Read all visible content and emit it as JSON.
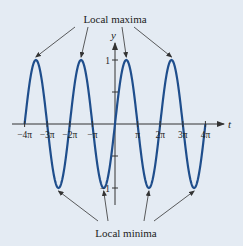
{
  "chart_data": {
    "type": "line",
    "function": "sin(t)",
    "xlabel": "t",
    "ylabel": "y",
    "xlim_pi": [
      -4,
      4
    ],
    "ylim": [
      -1,
      1
    ],
    "x_ticks": [
      {
        "value_pi": -4,
        "label": "−4π"
      },
      {
        "value_pi": -3,
        "label": "−3π"
      },
      {
        "value_pi": -2,
        "label": "−2π"
      },
      {
        "value_pi": -1,
        "label": "−π"
      },
      {
        "value_pi": 1,
        "label": "π"
      },
      {
        "value_pi": 2,
        "label": "2π"
      },
      {
        "value_pi": 3,
        "label": "3π"
      },
      {
        "value_pi": 4,
        "label": "4π"
      }
    ],
    "y_ticks": [
      {
        "value": 1,
        "label": "1"
      },
      {
        "value": 0.5,
        "label": ""
      },
      {
        "value": -0.5,
        "label": ""
      },
      {
        "value": -1,
        "label": "−1"
      }
    ],
    "series": [
      {
        "name": "sin(t)",
        "color": "#1f4e8c",
        "x_range_pi": [
          -4,
          4
        ]
      }
    ],
    "annotations": {
      "maxima": {
        "label": "Local maxima",
        "points_pi": [
          -3.5,
          -1.5,
          0.5,
          2.5
        ],
        "y": 1
      },
      "minima": {
        "label": "Local minima",
        "points_pi": [
          -2.5,
          -0.5,
          1.5,
          3.5
        ],
        "y": -1
      }
    },
    "grid": false
  },
  "colors": {
    "background": "#e4ebf3",
    "curve": "#1f4e8c",
    "axis": "#333333"
  }
}
